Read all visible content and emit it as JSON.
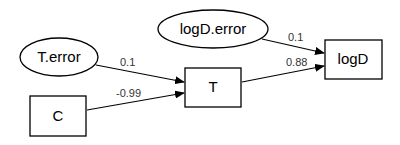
{
  "diagram": {
    "type": "path-diagram",
    "nodes": [
      {
        "id": "T.error",
        "label": "T.error",
        "shape": "ellipse"
      },
      {
        "id": "C",
        "label": "C",
        "shape": "box"
      },
      {
        "id": "T",
        "label": "T",
        "shape": "box"
      },
      {
        "id": "logD.error",
        "label": "logD.error",
        "shape": "ellipse"
      },
      {
        "id": "logD",
        "label": "logD",
        "shape": "box"
      }
    ],
    "edges": [
      {
        "from": "T.error",
        "to": "T",
        "label": "0.1"
      },
      {
        "from": "C",
        "to": "T",
        "label": "-0.99"
      },
      {
        "from": "logD.error",
        "to": "logD",
        "label": "0.1"
      },
      {
        "from": "T",
        "to": "logD",
        "label": "0.88"
      }
    ]
  }
}
